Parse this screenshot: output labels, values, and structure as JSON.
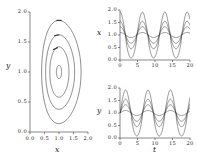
{
  "figure": {
    "panels": [
      "phase-portrait",
      "x-time-series",
      "y-time-series"
    ]
  },
  "chart_data": [
    {
      "type": "line",
      "name": "phase-portrait",
      "title": "",
      "xlabel": "x",
      "ylabel": "y",
      "xlim": [
        0.0,
        2.0
      ],
      "ylim": [
        0.0,
        2.0
      ],
      "xticks": [
        "0.0",
        "0.5",
        "1.0",
        "1.5",
        "2.0"
      ],
      "yticks": [
        "0.0",
        "0.5",
        "1.0",
        "1.5",
        "2.0"
      ],
      "xtick_values": [
        0.0,
        0.5,
        1.0,
        1.5,
        2.0
      ],
      "ytick_values": [
        0.0,
        0.5,
        1.0,
        1.5,
        2.0
      ],
      "grid": false,
      "legend": "none",
      "fixed_point": [
        1.0,
        1.0
      ],
      "annotations": [
        "direction arrows on orbits (counter-clockwise)"
      ],
      "series": [
        {
          "name": "orbit-1",
          "amplitude": 0.07,
          "rx": 0.09,
          "ry": 0.11
        },
        {
          "name": "orbit-2",
          "amplitude": 0.3,
          "rx": 0.33,
          "ry": 0.42
        },
        {
          "name": "orbit-3",
          "amplitude": 0.48,
          "rx": 0.5,
          "ry": 0.62
        },
        {
          "name": "orbit-4",
          "amplitude": 0.72,
          "rx": 0.68,
          "ry": 0.86
        }
      ]
    },
    {
      "type": "line",
      "name": "x-time-series",
      "title": "",
      "xlabel": "",
      "ylabel": "x",
      "xlim": [
        0,
        20
      ],
      "ylim": [
        0.0,
        2.0
      ],
      "xticks": [
        "0",
        "5",
        "10",
        "15",
        "20"
      ],
      "yticks": [
        "0.0",
        "0.5",
        "1.0",
        "1.5",
        "2.0"
      ],
      "xtick_values": [
        0,
        5,
        10,
        15,
        20
      ],
      "ytick_values": [
        0.0,
        0.5,
        1.0,
        1.5,
        2.0
      ],
      "grid": false,
      "legend": "none",
      "period": 6.4,
      "baseline": 1.0,
      "series": [
        {
          "name": "x-amp-1",
          "amplitude": 0.1,
          "sharpness": 1.0
        },
        {
          "name": "x-amp-2",
          "amplitude": 0.33,
          "sharpness": 1.5
        },
        {
          "name": "x-amp-3",
          "amplitude": 0.55,
          "sharpness": 2.2
        },
        {
          "name": "x-amp-4",
          "amplitude": 0.92,
          "sharpness": 3.4
        }
      ]
    },
    {
      "type": "line",
      "name": "y-time-series",
      "title": "",
      "xlabel": "t",
      "ylabel": "y",
      "xlim": [
        0,
        20
      ],
      "ylim": [
        0.0,
        2.0
      ],
      "xticks": [
        "0",
        "5",
        "10",
        "15",
        "20"
      ],
      "yticks": [
        "0.0",
        "0.5",
        "1.0",
        "1.5",
        "2.0"
      ],
      "xtick_values": [
        0,
        5,
        10,
        15,
        20
      ],
      "ytick_values": [
        0.0,
        0.5,
        1.0,
        1.5,
        2.0
      ],
      "grid": false,
      "legend": "none",
      "period": 6.4,
      "baseline": 1.0,
      "phase_shift": 1.6,
      "series": [
        {
          "name": "y-amp-1",
          "amplitude": 0.1,
          "sharpness": 1.0
        },
        {
          "name": "y-amp-2",
          "amplitude": 0.33,
          "sharpness": 1.5
        },
        {
          "name": "y-amp-3",
          "amplitude": 0.55,
          "sharpness": 2.2
        },
        {
          "name": "y-amp-4",
          "amplitude": 0.92,
          "sharpness": 3.4
        }
      ]
    }
  ],
  "labels": {
    "phase_x": "x",
    "phase_y": "y",
    "ts_x_ylabel": "x",
    "ts_y_ylabel": "y",
    "ts_xlabel": "t"
  },
  "colors": {
    "line": "#2b2b2b",
    "axis": "#3a3a3a",
    "text": "#1a1a1a",
    "background": "#ffffff"
  }
}
